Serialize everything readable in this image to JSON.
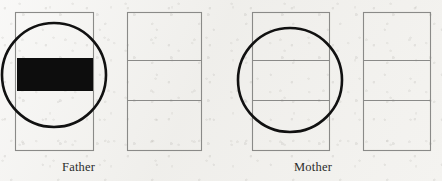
{
  "figure": {
    "type": "diagram",
    "background_color": "#f1f0ed",
    "outline_color": "#8a8a88",
    "highlight_color": "#111111",
    "fill_color": "#0d0d0d",
    "captions": {
      "father": "Father",
      "mother": "Mother"
    },
    "panels": [
      {
        "id": "father-chromosome-1",
        "parent": "Father",
        "x": 15,
        "y": 12,
        "width": 78,
        "height": 138,
        "segments": 1,
        "dividers": [],
        "filled_band": {
          "y": 58,
          "height": 33,
          "color": "#0d0d0d"
        },
        "circle": {
          "cx": 54,
          "cy": 75,
          "r": 52
        }
      },
      {
        "id": "father-chromosome-2",
        "parent": "Father",
        "x": 127,
        "y": 12,
        "width": 74,
        "height": 138,
        "segments": 3,
        "dividers": [
          60,
          100
        ],
        "filled_band": null,
        "circle": null
      },
      {
        "id": "mother-chromosome-1",
        "parent": "Mother",
        "x": 252,
        "y": 12,
        "width": 77,
        "height": 138,
        "segments": 3,
        "dividers": [
          60,
          100
        ],
        "filled_band": null,
        "circle": {
          "cx": 290,
          "cy": 80,
          "r": 52
        }
      },
      {
        "id": "mother-chromosome-2",
        "parent": "Mother",
        "x": 363,
        "y": 12,
        "width": 67,
        "height": 138,
        "segments": 3,
        "dividers": [
          60,
          100
        ],
        "filled_band": null,
        "circle": null
      }
    ]
  }
}
